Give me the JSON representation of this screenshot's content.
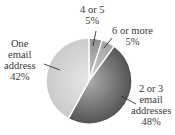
{
  "chart_data": {
    "type": "pie",
    "title": "",
    "categories": [
      "4 or 5",
      "6 or more",
      "2 or 3 email addresses",
      "One email address"
    ],
    "values": [
      5,
      5,
      48,
      42
    ],
    "unit": "%",
    "start_angle_deg": 0,
    "direction": "clockwise",
    "colors": [
      "#8a8a8a",
      "#9c9c9c",
      "#4a4a4a",
      "#c8c8c8"
    ],
    "labels": [
      {
        "lines": [
          "4 or 5",
          "5%"
        ]
      },
      {
        "lines": [
          "6 or more",
          "5%"
        ]
      },
      {
        "lines": [
          "2 or 3",
          "email",
          "addresses",
          "48%"
        ]
      },
      {
        "lines": [
          "One",
          "email",
          "address",
          "42%"
        ]
      }
    ]
  }
}
